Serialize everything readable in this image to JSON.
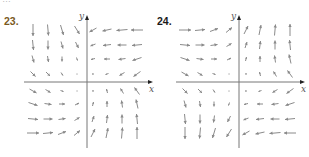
{
  "top_fragment": "…",
  "colors": {
    "label": "#7a5a1e",
    "axis": "#777777",
    "arrow": "#8a8a8a"
  },
  "panels": [
    {
      "number": "23.",
      "x_axis_label": "x",
      "y_axis_label": "y",
      "origin": [
        87,
        82
      ],
      "x_axis": [
        24,
        153
      ],
      "y_axis": [
        15,
        148
      ],
      "cols": [
        33,
        48,
        62,
        77,
        93,
        107,
        122,
        137
      ],
      "rows": [
        30,
        45,
        59,
        74,
        91,
        104,
        119,
        133
      ],
      "arrows": [
        [
          [
            0,
            12
          ],
          [
            1,
            11
          ],
          [
            3,
            10
          ],
          [
            5,
            8
          ],
          [
            -7,
            4
          ],
          [
            -9,
            2
          ],
          [
            -11,
            1
          ],
          [
            -12,
            0
          ]
        ],
        [
          [
            1,
            10
          ],
          [
            0,
            9
          ],
          [
            2,
            7
          ],
          [
            3,
            6
          ],
          [
            -5,
            2
          ],
          [
            -8,
            1
          ],
          [
            -9,
            0
          ],
          [
            -10,
            1
          ]
        ],
        [
          [
            2,
            7
          ],
          [
            1,
            6
          ],
          [
            0,
            5
          ],
          [
            1,
            3
          ],
          [
            -4,
            1
          ],
          [
            -6,
            0
          ],
          [
            -7,
            1
          ],
          [
            -9,
            3
          ]
        ],
        [
          [
            5,
            5
          ],
          [
            4,
            4
          ],
          [
            2,
            3
          ],
          [
            0,
            1
          ],
          [
            -2,
            0
          ],
          [
            -3,
            1
          ],
          [
            -5,
            3
          ],
          [
            -7,
            5
          ]
        ],
        [
          [
            7,
            4
          ],
          [
            5,
            3
          ],
          [
            3,
            1
          ],
          [
            1,
            0
          ],
          [
            0,
            -2
          ],
          [
            -1,
            -4
          ],
          [
            -3,
            -5
          ],
          [
            -5,
            -7
          ]
        ],
        [
          [
            9,
            3
          ],
          [
            7,
            1
          ],
          [
            6,
            0
          ],
          [
            4,
            -2
          ],
          [
            1,
            -4
          ],
          [
            0,
            -6
          ],
          [
            -1,
            -7
          ],
          [
            -2,
            -9
          ]
        ],
        [
          [
            10,
            1
          ],
          [
            9,
            0
          ],
          [
            7,
            -1
          ],
          [
            5,
            -3
          ],
          [
            2,
            -6
          ],
          [
            1,
            -8
          ],
          [
            0,
            -9
          ],
          [
            -1,
            -10
          ]
        ],
        [
          [
            12,
            0
          ],
          [
            10,
            -1
          ],
          [
            8,
            -3
          ],
          [
            6,
            -5
          ],
          [
            4,
            -8
          ],
          [
            2,
            -10
          ],
          [
            1,
            -11
          ],
          [
            0,
            -12
          ]
        ]
      ]
    },
    {
      "number": "24.",
      "x_axis_label": "x",
      "y_axis_label": "y",
      "origin": [
        239,
        82
      ],
      "x_axis": [
        176,
        305
      ],
      "y_axis": [
        15,
        148
      ],
      "cols": [
        185,
        200,
        214,
        229,
        246,
        260,
        275,
        290
      ],
      "rows": [
        30,
        45,
        59,
        74,
        91,
        104,
        119,
        133
      ],
      "arrows": [
        [
          [
            12,
            0
          ],
          [
            10,
            -1
          ],
          [
            8,
            -3
          ],
          [
            6,
            -5
          ],
          [
            4,
            -8
          ],
          [
            2,
            -10
          ],
          [
            1,
            -11
          ],
          [
            0,
            -12
          ]
        ],
        [
          [
            10,
            1
          ],
          [
            9,
            0
          ],
          [
            7,
            -1
          ],
          [
            5,
            -3
          ],
          [
            2,
            -6
          ],
          [
            1,
            -8
          ],
          [
            0,
            -9
          ],
          [
            -1,
            -10
          ]
        ],
        [
          [
            9,
            3
          ],
          [
            7,
            1
          ],
          [
            6,
            0
          ],
          [
            4,
            -2
          ],
          [
            1,
            -4
          ],
          [
            0,
            -6
          ],
          [
            -1,
            -7
          ],
          [
            -2,
            -9
          ]
        ],
        [
          [
            7,
            4
          ],
          [
            5,
            3
          ],
          [
            3,
            1
          ],
          [
            1,
            0
          ],
          [
            0,
            -2
          ],
          [
            -1,
            -4
          ],
          [
            -3,
            -5
          ],
          [
            -5,
            -7
          ]
        ],
        [
          [
            5,
            5
          ],
          [
            4,
            4
          ],
          [
            2,
            3
          ],
          [
            0,
            1
          ],
          [
            -2,
            0
          ],
          [
            -3,
            1
          ],
          [
            -5,
            3
          ],
          [
            -7,
            5
          ]
        ],
        [
          [
            2,
            7
          ],
          [
            1,
            6
          ],
          [
            0,
            5
          ],
          [
            -1,
            3
          ],
          [
            -4,
            1
          ],
          [
            -6,
            0
          ],
          [
            -7,
            1
          ],
          [
            -9,
            3
          ]
        ],
        [
          [
            1,
            10
          ],
          [
            0,
            9
          ],
          [
            -1,
            7
          ],
          [
            -3,
            6
          ],
          [
            -5,
            2
          ],
          [
            -8,
            1
          ],
          [
            -9,
            0
          ],
          [
            -10,
            1
          ]
        ],
        [
          [
            0,
            12
          ],
          [
            -1,
            11
          ],
          [
            -3,
            10
          ],
          [
            -5,
            8
          ],
          [
            -7,
            4
          ],
          [
            -9,
            2
          ],
          [
            -11,
            1
          ],
          [
            -12,
            0
          ]
        ]
      ]
    }
  ]
}
